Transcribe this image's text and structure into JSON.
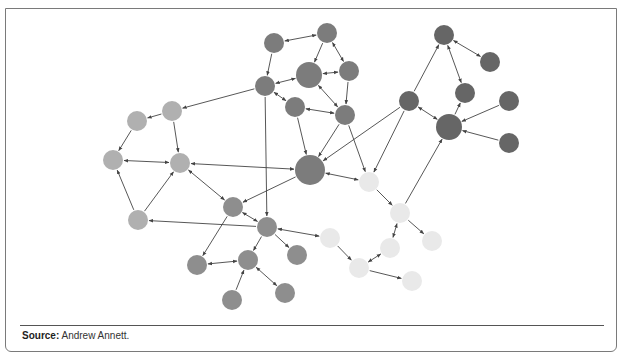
{
  "figure": {
    "source_label": "Source:",
    "source_text": " Andrew Annett."
  },
  "colors": {
    "cluster_light": "#b0b0b0",
    "cluster_medium": "#8e8e8e",
    "cluster_dark": "#7c7c7c",
    "cluster_darkest": "#666666",
    "cluster_pale": "#e9e9e9",
    "edge": "#444444"
  },
  "graph": {
    "nodes": [
      {
        "id": "A1",
        "x": 137,
        "y": 121,
        "r": 10,
        "cluster": "cluster_light"
      },
      {
        "id": "A2",
        "x": 172,
        "y": 111,
        "r": 10,
        "cluster": "cluster_light"
      },
      {
        "id": "A3",
        "x": 113,
        "y": 160,
        "r": 10,
        "cluster": "cluster_light"
      },
      {
        "id": "A4",
        "x": 180,
        "y": 163,
        "r": 10,
        "cluster": "cluster_light"
      },
      {
        "id": "A5",
        "x": 138,
        "y": 220,
        "r": 10,
        "cluster": "cluster_light"
      },
      {
        "id": "B1",
        "x": 233,
        "y": 207,
        "r": 10,
        "cluster": "cluster_medium"
      },
      {
        "id": "B2",
        "x": 267,
        "y": 227,
        "r": 10,
        "cluster": "cluster_medium"
      },
      {
        "id": "B3",
        "x": 197,
        "y": 265,
        "r": 10,
        "cluster": "cluster_medium"
      },
      {
        "id": "B4",
        "x": 248,
        "y": 260,
        "r": 10,
        "cluster": "cluster_medium"
      },
      {
        "id": "B5",
        "x": 297,
        "y": 255,
        "r": 10,
        "cluster": "cluster_medium"
      },
      {
        "id": "B6",
        "x": 232,
        "y": 300,
        "r": 10,
        "cluster": "cluster_medium"
      },
      {
        "id": "B7",
        "x": 285,
        "y": 293,
        "r": 10,
        "cluster": "cluster_medium"
      },
      {
        "id": "C1",
        "x": 274,
        "y": 43,
        "r": 10,
        "cluster": "cluster_dark"
      },
      {
        "id": "C2",
        "x": 327,
        "y": 33,
        "r": 10,
        "cluster": "cluster_dark"
      },
      {
        "id": "C3",
        "x": 265,
        "y": 86,
        "r": 10,
        "cluster": "cluster_dark"
      },
      {
        "id": "C4",
        "x": 309,
        "y": 75,
        "r": 13,
        "cluster": "cluster_dark"
      },
      {
        "id": "C5",
        "x": 349,
        "y": 71,
        "r": 10,
        "cluster": "cluster_dark"
      },
      {
        "id": "C6",
        "x": 295,
        "y": 107,
        "r": 10,
        "cluster": "cluster_dark"
      },
      {
        "id": "C7",
        "x": 345,
        "y": 115,
        "r": 10,
        "cluster": "cluster_dark"
      },
      {
        "id": "C8",
        "x": 310,
        "y": 170,
        "r": 15,
        "cluster": "cluster_dark"
      },
      {
        "id": "D1",
        "x": 444,
        "y": 35,
        "r": 10,
        "cluster": "cluster_darkest"
      },
      {
        "id": "D2",
        "x": 490,
        "y": 62,
        "r": 10,
        "cluster": "cluster_darkest"
      },
      {
        "id": "D3",
        "x": 409,
        "y": 101,
        "r": 10,
        "cluster": "cluster_darkest"
      },
      {
        "id": "D4",
        "x": 465,
        "y": 93,
        "r": 10,
        "cluster": "cluster_darkest"
      },
      {
        "id": "D5",
        "x": 449,
        "y": 127,
        "r": 13,
        "cluster": "cluster_darkest"
      },
      {
        "id": "D6",
        "x": 509,
        "y": 101,
        "r": 10,
        "cluster": "cluster_darkest"
      },
      {
        "id": "D7",
        "x": 509,
        "y": 143,
        "r": 10,
        "cluster": "cluster_darkest"
      },
      {
        "id": "E1",
        "x": 369,
        "y": 182,
        "r": 10,
        "cluster": "cluster_pale"
      },
      {
        "id": "E2",
        "x": 400,
        "y": 213,
        "r": 10,
        "cluster": "cluster_pale"
      },
      {
        "id": "E3",
        "x": 330,
        "y": 238,
        "r": 10,
        "cluster": "cluster_pale"
      },
      {
        "id": "E4",
        "x": 390,
        "y": 248,
        "r": 10,
        "cluster": "cluster_pale"
      },
      {
        "id": "E5",
        "x": 432,
        "y": 241,
        "r": 10,
        "cluster": "cluster_pale"
      },
      {
        "id": "E6",
        "x": 359,
        "y": 268,
        "r": 10,
        "cluster": "cluster_pale"
      },
      {
        "id": "E7",
        "x": 412,
        "y": 281,
        "r": 10,
        "cluster": "cluster_pale"
      }
    ],
    "edges": [
      {
        "from": "C3",
        "to": "A2",
        "dir": "to"
      },
      {
        "from": "A2",
        "to": "A1",
        "dir": "to"
      },
      {
        "from": "A1",
        "to": "A3",
        "dir": "to"
      },
      {
        "from": "A2",
        "to": "A4",
        "dir": "to"
      },
      {
        "from": "A3",
        "to": "A4",
        "dir": "both"
      },
      {
        "from": "A5",
        "to": "A3",
        "dir": "to"
      },
      {
        "from": "A5",
        "to": "A4",
        "dir": "to"
      },
      {
        "from": "B2",
        "to": "A5",
        "dir": "to"
      },
      {
        "from": "C8",
        "to": "A4",
        "dir": "both"
      },
      {
        "from": "A4",
        "to": "B1",
        "dir": "both"
      },
      {
        "from": "C8",
        "to": "B1",
        "dir": "to"
      },
      {
        "from": "C3",
        "to": "B2",
        "dir": "to"
      },
      {
        "from": "B1",
        "to": "B2",
        "dir": "both"
      },
      {
        "from": "B1",
        "to": "B3",
        "dir": "to"
      },
      {
        "from": "B2",
        "to": "B4",
        "dir": "to"
      },
      {
        "from": "B3",
        "to": "B4",
        "dir": "both"
      },
      {
        "from": "B2",
        "to": "B5",
        "dir": "to"
      },
      {
        "from": "B2",
        "to": "E3",
        "dir": "both"
      },
      {
        "from": "B6",
        "to": "B4",
        "dir": "to"
      },
      {
        "from": "B4",
        "to": "B7",
        "dir": "both"
      },
      {
        "from": "C1",
        "to": "C2",
        "dir": "both"
      },
      {
        "from": "C1",
        "to": "C3",
        "dir": "to"
      },
      {
        "from": "C3",
        "to": "C4",
        "dir": "both"
      },
      {
        "from": "C2",
        "to": "C4",
        "dir": "to"
      },
      {
        "from": "C2",
        "to": "C5",
        "dir": "both"
      },
      {
        "from": "C4",
        "to": "C5",
        "dir": "both"
      },
      {
        "from": "C3",
        "to": "C6",
        "dir": "both"
      },
      {
        "from": "C4",
        "to": "C7",
        "dir": "both"
      },
      {
        "from": "C5",
        "to": "C7",
        "dir": "to"
      },
      {
        "from": "C6",
        "to": "C7",
        "dir": "both"
      },
      {
        "from": "C6",
        "to": "C8",
        "dir": "to"
      },
      {
        "from": "C7",
        "to": "C8",
        "dir": "to"
      },
      {
        "from": "D3",
        "to": "C8",
        "dir": "to"
      },
      {
        "from": "C8",
        "to": "E1",
        "dir": "both"
      },
      {
        "from": "C7",
        "to": "E1",
        "dir": "to"
      },
      {
        "from": "D3",
        "to": "E1",
        "dir": "to"
      },
      {
        "from": "D3",
        "to": "D1",
        "dir": "to"
      },
      {
        "from": "D1",
        "to": "D2",
        "dir": "both"
      },
      {
        "from": "D1",
        "to": "D4",
        "dir": "both"
      },
      {
        "from": "D3",
        "to": "D5",
        "dir": "both"
      },
      {
        "from": "D5",
        "to": "D4",
        "dir": "to"
      },
      {
        "from": "D6",
        "to": "D5",
        "dir": "to"
      },
      {
        "from": "D7",
        "to": "D5",
        "dir": "to"
      },
      {
        "from": "E2",
        "to": "D5",
        "dir": "to"
      },
      {
        "from": "E1",
        "to": "E2",
        "dir": "to"
      },
      {
        "from": "E2",
        "to": "E4",
        "dir": "both"
      },
      {
        "from": "E2",
        "to": "E5",
        "dir": "to"
      },
      {
        "from": "E3",
        "to": "E6",
        "dir": "to"
      },
      {
        "from": "E6",
        "to": "E4",
        "dir": "both"
      },
      {
        "from": "E6",
        "to": "E7",
        "dir": "to"
      }
    ]
  }
}
